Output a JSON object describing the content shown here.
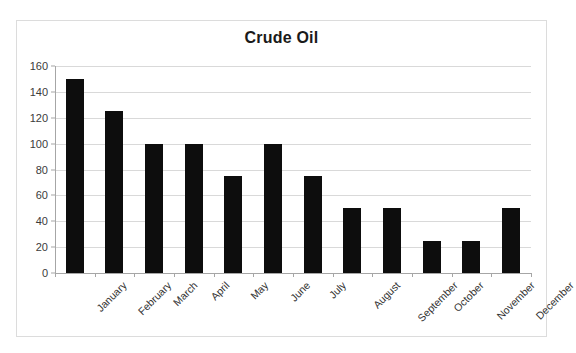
{
  "top_sliver_text": " ",
  "chart": {
    "title": "Crude Oil",
    "frame_color": "#dcdcdc",
    "bar_color": "#0d0d0d",
    "gridline_color": "#d9d9d9",
    "axis_color": "#a6a6a6"
  },
  "chart_data": {
    "type": "bar",
    "title": "Crude Oil",
    "xlabel": "",
    "ylabel": "",
    "categories": [
      "January",
      "February",
      "March",
      "April",
      "May",
      "June",
      "July",
      "August",
      "September",
      "October",
      "November",
      "December"
    ],
    "values": [
      150,
      125,
      100,
      100,
      75,
      100,
      75,
      50,
      50,
      25,
      25,
      50
    ],
    "ylim": [
      0,
      160
    ],
    "ytick_values": [
      0,
      20,
      40,
      60,
      80,
      100,
      120,
      140,
      160
    ],
    "ytick_labels": [
      "0",
      "20",
      "40",
      "60",
      "80",
      "100",
      "120",
      "140",
      "160"
    ],
    "grid": "horizontal",
    "legend": "none",
    "series": [
      {
        "name": "Crude Oil",
        "values": [
          150,
          125,
          100,
          100,
          75,
          100,
          75,
          50,
          50,
          25,
          25,
          50
        ]
      }
    ]
  }
}
